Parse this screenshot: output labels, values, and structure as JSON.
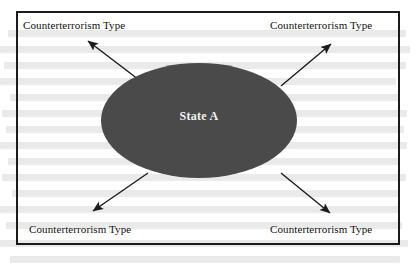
{
  "diagram": {
    "type": "hub-and-spoke",
    "title_present": false,
    "center": {
      "shape": "ellipse",
      "label": "State A",
      "fill_color": "#4a4a4a",
      "text_color": "#f2f2f2"
    },
    "frame": {
      "border_color": "#1b1b1b",
      "background_color": "#ffffff"
    },
    "nodes": [
      {
        "id": "top-left",
        "label": "Counterterrorism Type"
      },
      {
        "id": "top-right",
        "label": "Counterterrorism Type"
      },
      {
        "id": "bottom-left",
        "label": "Counterterrorism Type"
      },
      {
        "id": "bottom-right",
        "label": "Counterterrorism Type"
      }
    ],
    "arrows": [
      {
        "id": "arrow-to-top-left",
        "from": "State A",
        "to": "Counterterrorism Type",
        "direction": "up-left",
        "color": "#1b1b1b"
      },
      {
        "id": "arrow-to-top-right",
        "from": "State A",
        "to": "Counterterrorism Type",
        "direction": "up-right",
        "color": "#1b1b1b"
      },
      {
        "id": "arrow-to-bottom-left",
        "from": "State A",
        "to": "Counterterrorism Type",
        "direction": "down-left",
        "color": "#1b1b1b"
      },
      {
        "id": "arrow-to-bottom-right",
        "from": "State A",
        "to": "Counterterrorism Type",
        "direction": "down-right",
        "color": "#1b1b1b"
      }
    ]
  }
}
